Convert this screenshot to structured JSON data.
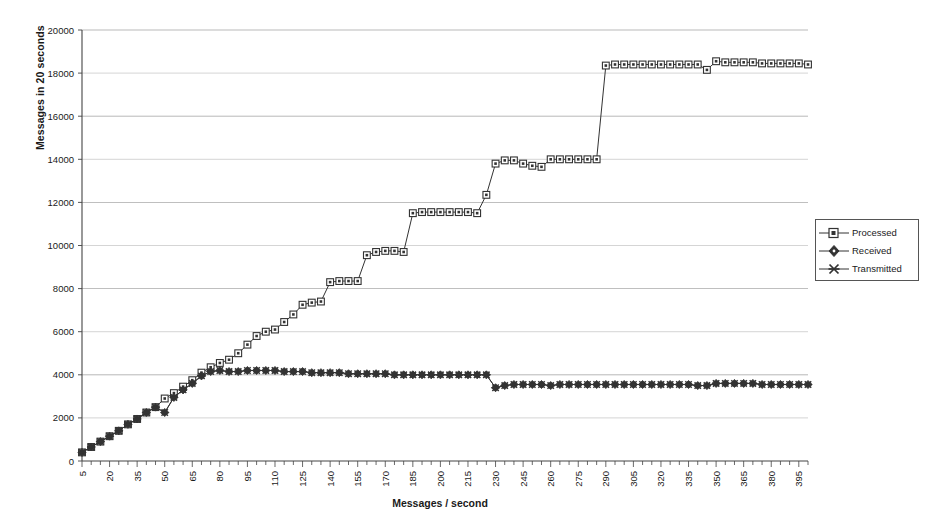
{
  "chart_data": {
    "type": "line",
    "title": "",
    "xlabel": "Messages / second",
    "ylabel": "Messages in 20 seconds",
    "xlim": [
      5,
      400
    ],
    "ylim": [
      0,
      20000
    ],
    "ytick_step": 2000,
    "yticks": [
      0,
      2000,
      4000,
      6000,
      8000,
      10000,
      12000,
      14000,
      16000,
      18000,
      20000
    ],
    "xticks_labeled": [
      5,
      20,
      35,
      50,
      65,
      80,
      95,
      110,
      125,
      140,
      155,
      170,
      185,
      200,
      215,
      230,
      245,
      260,
      275,
      290,
      305,
      320,
      335,
      350,
      365,
      380,
      395
    ],
    "xtick_minor_step": 5,
    "grid": "horizontal",
    "legend_position": "right",
    "x": [
      5,
      10,
      15,
      20,
      25,
      30,
      35,
      40,
      45,
      50,
      55,
      60,
      65,
      70,
      75,
      80,
      85,
      90,
      95,
      100,
      105,
      110,
      115,
      120,
      125,
      130,
      135,
      140,
      145,
      150,
      155,
      160,
      165,
      170,
      175,
      180,
      185,
      190,
      195,
      200,
      205,
      210,
      215,
      220,
      225,
      230,
      235,
      240,
      245,
      250,
      255,
      260,
      265,
      270,
      275,
      280,
      285,
      290,
      295,
      300,
      305,
      310,
      315,
      320,
      325,
      330,
      335,
      340,
      345,
      350,
      355,
      360,
      365,
      370,
      375,
      380,
      385,
      390,
      395,
      400
    ],
    "series": [
      {
        "name": "Processed",
        "marker": "square",
        "values": [
          400,
          650,
          900,
          1150,
          1400,
          1700,
          1950,
          2250,
          2500,
          2900,
          3150,
          3450,
          3750,
          4100,
          4350,
          4550,
          4700,
          5000,
          5400,
          5800,
          6000,
          6100,
          6450,
          6800,
          7250,
          7350,
          7400,
          8300,
          8350,
          8350,
          8350,
          9550,
          9700,
          9750,
          9750,
          9700,
          11500,
          11550,
          11550,
          11550,
          11550,
          11550,
          11550,
          11500,
          12350,
          13800,
          13950,
          13950,
          13800,
          13700,
          13650,
          14000,
          14000,
          14000,
          14000,
          14000,
          14000,
          18350,
          18400,
          18400,
          18400,
          18400,
          18400,
          18400,
          18400,
          18400,
          18400,
          18400,
          18150,
          18550,
          18500,
          18500,
          18500,
          18500,
          18450,
          18450,
          18450,
          18450,
          18450,
          18400
        ]
      },
      {
        "name": "Received",
        "marker": "diamond",
        "values": [
          400,
          650,
          900,
          1150,
          1400,
          1700,
          1950,
          2250,
          2500,
          2250,
          2950,
          3300,
          3600,
          3950,
          4150,
          4200,
          4150,
          4150,
          4200,
          4200,
          4200,
          4200,
          4150,
          4150,
          4150,
          4100,
          4100,
          4100,
          4100,
          4050,
          4050,
          4050,
          4050,
          4050,
          4000,
          4000,
          4000,
          4000,
          4000,
          4000,
          4000,
          4000,
          4000,
          4000,
          4000,
          3400,
          3500,
          3550,
          3550,
          3550,
          3550,
          3500,
          3550,
          3550,
          3550,
          3550,
          3550,
          3550,
          3550,
          3550,
          3550,
          3550,
          3550,
          3550,
          3550,
          3550,
          3550,
          3500,
          3500,
          3600,
          3600,
          3600,
          3600,
          3600,
          3550,
          3550,
          3550,
          3550,
          3550,
          3550
        ]
      },
      {
        "name": "Transmitted",
        "marker": "cross",
        "values": [
          400,
          650,
          900,
          1150,
          1400,
          1700,
          1950,
          2250,
          2500,
          2250,
          2950,
          3300,
          3600,
          3950,
          4150,
          4200,
          4150,
          4150,
          4200,
          4200,
          4200,
          4200,
          4150,
          4150,
          4150,
          4100,
          4100,
          4100,
          4100,
          4050,
          4050,
          4050,
          4050,
          4050,
          4000,
          4000,
          4000,
          4000,
          4000,
          4000,
          4000,
          4000,
          4000,
          4000,
          4000,
          3400,
          3500,
          3550,
          3550,
          3550,
          3550,
          3500,
          3550,
          3550,
          3550,
          3550,
          3550,
          3550,
          3550,
          3550,
          3550,
          3550,
          3550,
          3550,
          3550,
          3550,
          3550,
          3500,
          3500,
          3600,
          3600,
          3600,
          3600,
          3600,
          3550,
          3550,
          3550,
          3550,
          3550,
          3550
        ]
      }
    ]
  },
  "legend": {
    "items": [
      {
        "label": "Processed",
        "marker": "square"
      },
      {
        "label": "Received",
        "marker": "diamond"
      },
      {
        "label": "Transmitted",
        "marker": "cross"
      }
    ]
  },
  "axes": {
    "y_title": "Messages in 20 seconds",
    "x_title": "Messages / second"
  },
  "colors": {
    "line": "#333333",
    "grid": "#8a8a8a",
    "axis": "#444444",
    "text": "#1a1a1a",
    "background": "#ffffff"
  }
}
